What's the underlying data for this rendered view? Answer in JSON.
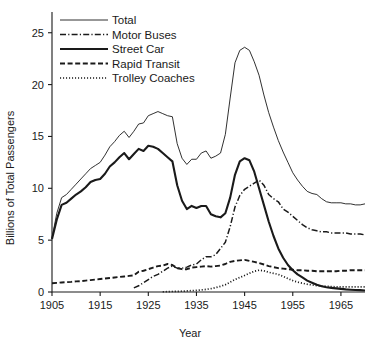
{
  "chart_data": {
    "type": "line",
    "title": "",
    "xlabel": "Year",
    "ylabel": "Billions of Total Passengers",
    "xlim": [
      1905,
      1970
    ],
    "ylim": [
      0,
      27
    ],
    "xticks": [
      1905,
      1915,
      1925,
      1935,
      1945,
      1955,
      1965
    ],
    "yticks": [
      0,
      5,
      10,
      15,
      20,
      25
    ],
    "grid": false,
    "legend_position": "top-left",
    "legend": [
      "Total",
      "Motor Buses",
      "Street Car",
      "Rapid Transit",
      "Trolley Coaches"
    ],
    "series": [
      {
        "name": "Total",
        "style": "solid-thin",
        "x": [
          1905,
          1906,
          1907,
          1908,
          1909,
          1910,
          1911,
          1912,
          1913,
          1914,
          1915,
          1916,
          1917,
          1918,
          1919,
          1920,
          1921,
          1922,
          1923,
          1924,
          1925,
          1926,
          1927,
          1928,
          1929,
          1930,
          1931,
          1932,
          1933,
          1934,
          1935,
          1936,
          1937,
          1938,
          1939,
          1940,
          1941,
          1942,
          1943,
          1944,
          1945,
          1946,
          1947,
          1948,
          1949,
          1950,
          1951,
          1952,
          1953,
          1954,
          1955,
          1956,
          1957,
          1958,
          1959,
          1960,
          1961,
          1962,
          1963,
          1964,
          1965,
          1966,
          1967,
          1968,
          1969,
          1970
        ],
        "y": [
          5.2,
          7.6,
          9.1,
          9.4,
          9.9,
          10.4,
          10.9,
          11.4,
          11.9,
          12.2,
          12.5,
          13.2,
          14.0,
          14.5,
          15.1,
          15.5,
          14.9,
          15.5,
          16.2,
          16.3,
          17.0,
          17.2,
          17.4,
          17.2,
          17.0,
          16.9,
          14.3,
          12.9,
          12.3,
          12.8,
          12.8,
          13.4,
          13.6,
          12.9,
          13.1,
          13.4,
          15.2,
          18.7,
          22.1,
          23.3,
          23.6,
          23.3,
          22.2,
          20.9,
          19.0,
          17.3,
          15.9,
          14.6,
          13.5,
          12.5,
          11.5,
          10.8,
          10.2,
          9.7,
          9.5,
          9.4,
          9.0,
          8.7,
          8.6,
          8.6,
          8.6,
          8.5,
          8.5,
          8.4,
          8.4,
          8.5
        ]
      },
      {
        "name": "Motor Buses",
        "style": "dash-dot",
        "x": [
          1922,
          1923,
          1924,
          1925,
          1926,
          1927,
          1928,
          1929,
          1930,
          1931,
          1932,
          1933,
          1934,
          1935,
          1936,
          1937,
          1938,
          1939,
          1940,
          1941,
          1942,
          1943,
          1944,
          1945,
          1946,
          1947,
          1948,
          1949,
          1950,
          1951,
          1952,
          1953,
          1954,
          1955,
          1956,
          1957,
          1958,
          1959,
          1960,
          1961,
          1962,
          1963,
          1964,
          1965,
          1966,
          1967,
          1968,
          1969,
          1970
        ],
        "y": [
          0.4,
          0.6,
          0.9,
          1.2,
          1.5,
          1.7,
          2.0,
          2.3,
          2.5,
          2.3,
          2.3,
          2.4,
          2.6,
          2.7,
          3.1,
          3.4,
          3.4,
          3.6,
          4.2,
          4.8,
          6.3,
          8.2,
          9.3,
          9.9,
          10.2,
          10.5,
          10.8,
          10.3,
          9.4,
          9.0,
          8.7,
          8.0,
          7.7,
          7.3,
          6.9,
          6.5,
          6.2,
          6.0,
          5.9,
          5.8,
          5.8,
          5.7,
          5.7,
          5.7,
          5.7,
          5.6,
          5.6,
          5.6,
          5.5
        ]
      },
      {
        "name": "Street Car",
        "style": "solid-thick",
        "x": [
          1905,
          1906,
          1907,
          1908,
          1909,
          1910,
          1911,
          1912,
          1913,
          1914,
          1915,
          1916,
          1917,
          1918,
          1919,
          1920,
          1921,
          1922,
          1923,
          1924,
          1925,
          1926,
          1927,
          1928,
          1929,
          1930,
          1931,
          1932,
          1933,
          1934,
          1935,
          1936,
          1937,
          1938,
          1939,
          1940,
          1941,
          1942,
          1943,
          1944,
          1945,
          1946,
          1947,
          1948,
          1949,
          1950,
          1951,
          1952,
          1953,
          1954,
          1955,
          1956,
          1957,
          1958,
          1959,
          1960,
          1961,
          1962,
          1963,
          1964,
          1965,
          1966,
          1967,
          1968,
          1969,
          1970
        ],
        "y": [
          5.1,
          7.0,
          8.4,
          8.6,
          9.0,
          9.4,
          9.7,
          10.1,
          10.6,
          10.8,
          10.9,
          11.4,
          12.1,
          12.5,
          13.0,
          13.4,
          12.8,
          13.3,
          13.8,
          13.6,
          14.1,
          14.0,
          13.8,
          13.4,
          13.0,
          12.6,
          10.3,
          8.8,
          8.0,
          8.3,
          8.1,
          8.3,
          8.3,
          7.5,
          7.3,
          7.2,
          7.6,
          9.1,
          11.3,
          12.6,
          12.9,
          12.7,
          11.6,
          10.0,
          8.4,
          6.8,
          5.4,
          4.2,
          3.3,
          2.6,
          2.1,
          1.7,
          1.4,
          1.1,
          0.9,
          0.7,
          0.55,
          0.45,
          0.4,
          0.35,
          0.3,
          0.25,
          0.22,
          0.2,
          0.18,
          0.15
        ]
      },
      {
        "name": "Rapid Transit",
        "style": "dashed",
        "x": [
          1905,
          1906,
          1907,
          1908,
          1909,
          1910,
          1911,
          1912,
          1913,
          1914,
          1915,
          1916,
          1917,
          1918,
          1919,
          1920,
          1921,
          1922,
          1923,
          1924,
          1925,
          1926,
          1927,
          1928,
          1929,
          1930,
          1931,
          1932,
          1933,
          1934,
          1935,
          1936,
          1937,
          1938,
          1939,
          1940,
          1941,
          1942,
          1943,
          1944,
          1945,
          1946,
          1947,
          1948,
          1949,
          1950,
          1951,
          1952,
          1953,
          1954,
          1955,
          1956,
          1957,
          1958,
          1959,
          1960,
          1961,
          1962,
          1963,
          1964,
          1965,
          1966,
          1967,
          1968,
          1969,
          1970
        ],
        "y": [
          0.85,
          0.88,
          0.92,
          0.95,
          0.98,
          1.02,
          1.05,
          1.1,
          1.15,
          1.2,
          1.25,
          1.3,
          1.35,
          1.4,
          1.45,
          1.5,
          1.55,
          1.6,
          1.95,
          2.05,
          2.2,
          2.35,
          2.5,
          2.55,
          2.7,
          2.6,
          2.3,
          2.2,
          2.2,
          2.35,
          2.4,
          2.45,
          2.5,
          2.45,
          2.5,
          2.55,
          2.7,
          2.9,
          3.0,
          3.05,
          3.1,
          3.0,
          2.9,
          2.8,
          2.65,
          2.5,
          2.4,
          2.3,
          2.25,
          2.2,
          2.15,
          2.1,
          2.1,
          2.05,
          2.05,
          2.0,
          2.0,
          2.0,
          2.0,
          2.0,
          2.05,
          2.05,
          2.1,
          2.1,
          2.1,
          2.1
        ]
      },
      {
        "name": "Trolley Coaches",
        "style": "dotted",
        "x": [
          1928,
          1929,
          1930,
          1931,
          1932,
          1933,
          1934,
          1935,
          1936,
          1937,
          1938,
          1939,
          1940,
          1941,
          1942,
          1943,
          1944,
          1945,
          1946,
          1947,
          1948,
          1949,
          1950,
          1951,
          1952,
          1953,
          1954,
          1955,
          1956,
          1957,
          1958,
          1959,
          1960,
          1961,
          1962,
          1963,
          1964,
          1965,
          1966,
          1967,
          1968,
          1969,
          1970
        ],
        "y": [
          0.02,
          0.03,
          0.05,
          0.06,
          0.08,
          0.1,
          0.13,
          0.16,
          0.2,
          0.25,
          0.32,
          0.42,
          0.55,
          0.7,
          0.95,
          1.2,
          1.4,
          1.6,
          1.8,
          2.0,
          2.1,
          2.05,
          1.9,
          1.8,
          1.7,
          1.5,
          1.3,
          1.1,
          0.95,
          0.85,
          0.75,
          0.68,
          0.62,
          0.58,
          0.55,
          0.52,
          0.5,
          0.5,
          0.5,
          0.5,
          0.5,
          0.5,
          0.5
        ]
      }
    ]
  }
}
